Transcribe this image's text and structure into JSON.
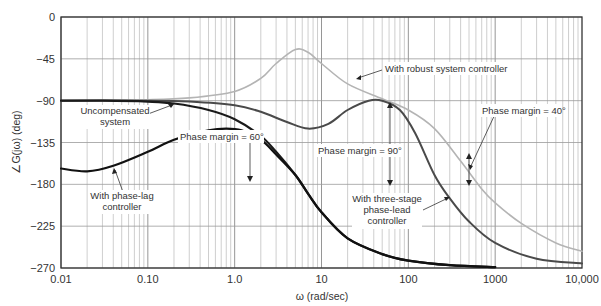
{
  "chart_data": {
    "type": "line",
    "title": "",
    "xlabel": "ω (rad/sec)",
    "ylabel": "∠G(jω) (deg)",
    "xscale": "log",
    "xlim": [
      0.01,
      10000
    ],
    "ylim": [
      -270,
      0
    ],
    "grid": true,
    "x_ticks": [
      "0.01",
      "0.10",
      "1.0",
      "10",
      "100",
      "1000",
      "10,000"
    ],
    "y_ticks": [
      "0",
      "−45",
      "−90",
      "−135",
      "−180",
      "−225",
      "−270"
    ],
    "series": [
      {
        "name": "Uncompensated system",
        "style": "thick-black",
        "color": "#1a1a1a",
        "x": [
          0.01,
          0.03,
          0.1,
          0.2,
          0.5,
          1,
          2,
          3,
          5,
          7,
          10,
          20,
          50,
          100,
          300,
          1000
        ],
        "y": [
          -90,
          -90,
          -91,
          -93,
          -100,
          -110,
          -128,
          -145,
          -170,
          -190,
          -210,
          -238,
          -255,
          -262,
          -267,
          -269
        ]
      },
      {
        "name": "With phase-lag controller",
        "style": "thick-black",
        "color": "#111111",
        "x": [
          0.01,
          0.02,
          0.04,
          0.1,
          0.2,
          0.5,
          0.8,
          1.2,
          2,
          3,
          5,
          7,
          10,
          20,
          50,
          100,
          300,
          1000
        ],
        "y": [
          -163,
          -166,
          -160,
          -145,
          -132,
          -122,
          -120,
          -122,
          -132,
          -148,
          -170,
          -190,
          -210,
          -238,
          -255,
          -262,
          -267,
          -269
        ]
      },
      {
        "name": "With three-stage phase-lead controller",
        "style": "dark-gray",
        "color": "#4a4a4a",
        "x": [
          0.01,
          0.1,
          0.3,
          1,
          2,
          4,
          7,
          12,
          20,
          35,
          50,
          80,
          120,
          200,
          300,
          500,
          1000,
          3000,
          10000
        ],
        "y": [
          -90,
          -90,
          -91,
          -95,
          -102,
          -113,
          -120,
          -115,
          -100,
          -90,
          -90,
          -100,
          -125,
          -170,
          -195,
          -220,
          -243,
          -260,
          -265
        ]
      },
      {
        "name": "With robust system controller",
        "style": "light-gray",
        "color": "#b4b4b4",
        "x": [
          0.01,
          0.1,
          0.3,
          1,
          2,
          3,
          5,
          7,
          10,
          20,
          50,
          100,
          200,
          400,
          700,
          1000,
          2000,
          5000,
          10000
        ],
        "y": [
          -90,
          -89,
          -87,
          -80,
          -66,
          -50,
          -35,
          -38,
          -50,
          -72,
          -88,
          -100,
          -120,
          -155,
          -185,
          -200,
          -222,
          -243,
          -252
        ]
      }
    ],
    "annotations": [
      {
        "text": "With robust system controller",
        "points_to": "robust curve near ω≈30"
      },
      {
        "text": "Uncompensated system",
        "points_to": "uncompensated curve near ω≈0.2"
      },
      {
        "text": "With phase-lag controller",
        "points_to": "phase-lag curve near ω≈0.04"
      },
      {
        "text": "Phase margin = 60°",
        "arrow": "down to −180 at ω≈1.5"
      },
      {
        "text": "Phase margin = 90°",
        "arrow": "vertical between −90 and −180 at ω≈45"
      },
      {
        "text": "With three-stage phase-lead controller",
        "points_to": "three-stage curve near ω≈200"
      },
      {
        "text": "Phase margin = 40°",
        "arrow": "vertical between −140 and −180 at ω≈530"
      }
    ]
  },
  "labels": {
    "xlabel": "ω (rad/sec)",
    "ylabel": "∠G(jω) (deg)",
    "ann_robust": "With robust system controller",
    "ann_uncomp_1": "Uncompensated",
    "ann_uncomp_2": "system",
    "ann_lag_1": "With phase-lag",
    "ann_lag_2": "controller",
    "ann_pm60": "Phase margin = 60°",
    "ann_pm90": "Phase margin = 90°",
    "ann_pm40": "Phase margin = 40°",
    "ann_lead_1": "With three-stage",
    "ann_lead_2": "phase-lead",
    "ann_lead_3": "controller"
  }
}
